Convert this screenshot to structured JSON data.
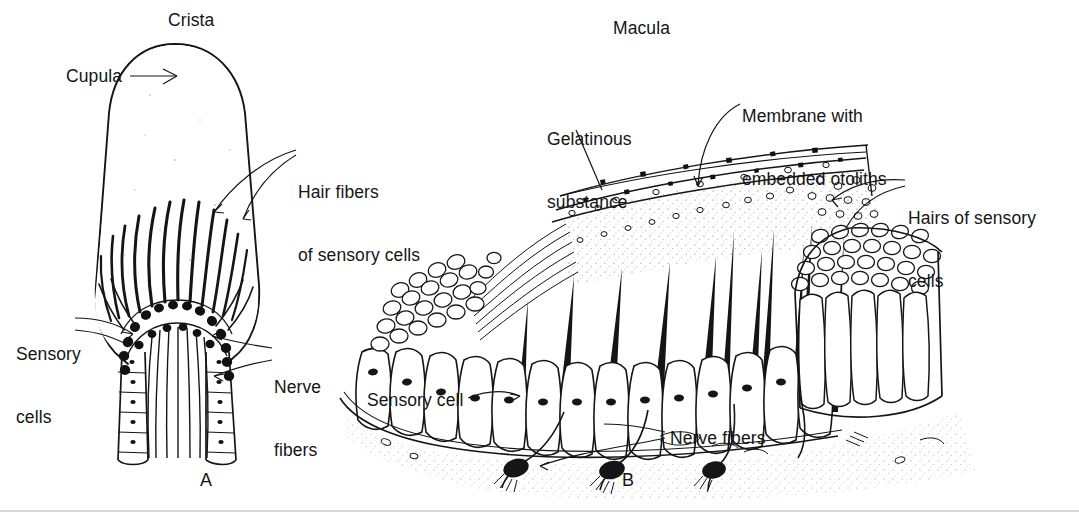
{
  "figure": {
    "kind": "anatomical-line-drawing",
    "background_color": "#ffffff",
    "ink_color": "#151515"
  },
  "panels": [
    {
      "id": "A",
      "letter": "A",
      "title": "Crista",
      "labels": [
        {
          "key": "crista",
          "text": "Crista"
        },
        {
          "key": "cupula",
          "text": "Cupula"
        },
        {
          "key": "hair_fibers",
          "text": "Hair fibers\nof sensory cells"
        },
        {
          "key": "sensory_cells",
          "text": "Sensory\ncells"
        },
        {
          "key": "nerve_fibers",
          "text": "Nerve\nfibers"
        }
      ]
    },
    {
      "id": "B",
      "letter": "B",
      "title": "Macula",
      "labels": [
        {
          "key": "macula",
          "text": "Macula"
        },
        {
          "key": "gelatinous",
          "text": "Gelatinous\nsubstance"
        },
        {
          "key": "membrane",
          "text": "Membrane with\nembedded otoliths"
        },
        {
          "key": "hairs_of",
          "text": "Hairs of sensory\ncells"
        },
        {
          "key": "sensory_cell",
          "text": "Sensory cell"
        },
        {
          "key": "nerve_fibers",
          "text": "Nerve fibers"
        }
      ]
    }
  ],
  "labels_flat": {
    "crista": "Crista",
    "cupula": "Cupula",
    "hair_fibers_l1": "Hair fibers",
    "hair_fibers_l2": "of sensory cells",
    "sensory_cells_l1": "Sensory",
    "sensory_cells_l2": "cells",
    "nerve_fibers_l1": "Nerve",
    "nerve_fibers_l2": "fibers",
    "macula": "Macula",
    "gelatinous_l1": "Gelatinous",
    "gelatinous_l2": "substance",
    "membrane_l1": "Membrane with",
    "membrane_l2": "embedded otoliths",
    "hairs_of_l1": "Hairs of sensory",
    "hairs_of_l2": "cells",
    "sensory_cell": "Sensory cell",
    "nerve_fibers_b": "Nerve fibers",
    "letter_a": "A",
    "letter_b": "B"
  }
}
